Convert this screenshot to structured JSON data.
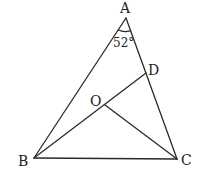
{
  "figure": {
    "type": "triangle-geometry",
    "points": {
      "A": {
        "label": "A",
        "x": 126,
        "y": 18
      },
      "B": {
        "label": "B",
        "x": 34,
        "y": 158
      },
      "C": {
        "label": "C",
        "x": 177,
        "y": 159
      },
      "D": {
        "label": "D",
        "x": 146,
        "y": 73
      },
      "O": {
        "label": "O",
        "x": 105,
        "y": 105
      }
    },
    "segments": [
      "AB",
      "AC",
      "BC",
      "BD",
      "OC"
    ],
    "angle": {
      "vertex": "A",
      "label": "52°"
    },
    "colors": {
      "line": "#2a2a2a",
      "text": "#222222",
      "background": "#ffffff"
    }
  }
}
